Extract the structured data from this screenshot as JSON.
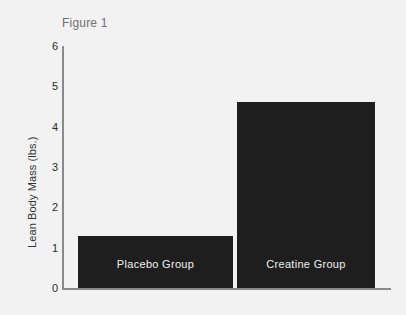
{
  "chart_data": {
    "type": "bar",
    "title": "Figure 1",
    "xlabel": "",
    "ylabel": "Lean Body Mass (lbs.)",
    "categories": [
      "Placebo Group",
      "Creatine Group"
    ],
    "values": [
      1.3,
      4.6
    ],
    "ylim": [
      0,
      6
    ],
    "yticks": [
      "0",
      "1",
      "2",
      "3",
      "4",
      "5",
      "6"
    ],
    "grid": false,
    "legend": "none",
    "bar_color": "#1e1e1e",
    "bar_label_color": "#f0f0f0",
    "axis_color": "#8a8a8a",
    "background_color": "#f2f2f2"
  }
}
